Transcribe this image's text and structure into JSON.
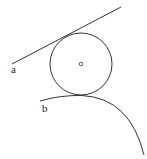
{
  "figure": {
    "labels": {
      "line": "a",
      "arc": "b",
      "center": "o"
    },
    "stroke_color": "#333333",
    "elements": [
      {
        "name": "line a",
        "type": "line",
        "from": [
          12,
          64
        ],
        "to": [
          121,
          7
        ]
      },
      {
        "name": "circle O",
        "type": "circle",
        "center": [
          81,
          64
        ],
        "radius": 31
      },
      {
        "name": "arc b",
        "type": "arc",
        "from": [
          40,
          101
        ],
        "to": [
          144,
          155
        ]
      }
    ]
  }
}
